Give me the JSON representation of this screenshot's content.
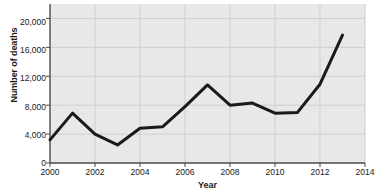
{
  "chart_data": {
    "type": "line",
    "title": "",
    "xlabel": "Year",
    "ylabel": "Number of deaths",
    "x": [
      2000,
      2001,
      2002,
      2003,
      2004,
      2005,
      2006,
      2007,
      2008,
      2009,
      2010,
      2011,
      2012,
      2013
    ],
    "values": [
      3200,
      6900,
      4000,
      2500,
      4800,
      5000,
      7800,
      10800,
      8000,
      8300,
      6900,
      7000,
      10900,
      17700
    ],
    "series": [
      {
        "name": "Number of deaths",
        "values": [
          3200,
          6900,
          4000,
          2500,
          4800,
          5000,
          7800,
          10800,
          8000,
          8300,
          6900,
          7000,
          10900,
          17700
        ]
      }
    ],
    "xlim": [
      2000,
      2014
    ],
    "ylim": [
      0,
      22000
    ],
    "x_ticks": [
      2000,
      2002,
      2004,
      2006,
      2008,
      2010,
      2012,
      2014
    ],
    "x_tick_labels": [
      "2000",
      "2002",
      "2004",
      "2006",
      "2008",
      "2010",
      "2012",
      "2014"
    ],
    "y_ticks": [
      0,
      4000,
      8000,
      12000,
      16000,
      20000
    ],
    "y_tick_labels": [
      "0",
      "4,000",
      "8,000",
      "12,000",
      "16,000",
      "20,000"
    ],
    "grid": true,
    "legend": false,
    "line_color": "#1a1a1a",
    "plot_background": "#e8e8e8",
    "grid_color": "#cfcfcf"
  }
}
